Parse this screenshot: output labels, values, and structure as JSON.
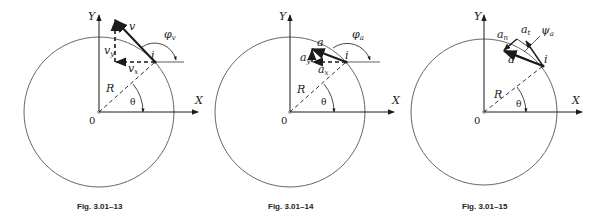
{
  "figures": [
    {
      "id": "fig13",
      "caption": "Fig. 3.01–13",
      "axis_x": "X",
      "axis_y": "Y",
      "origin": "0",
      "radius_label": "R",
      "angle_label": "θ",
      "point_label": "i",
      "vector_label": "v",
      "component_y": "v",
      "component_y_sub": "y",
      "component_x": "v",
      "component_x_sub": "x",
      "angle2": "φ",
      "angle2_sub": "v"
    },
    {
      "id": "fig14",
      "caption": "Fig. 3.01–14",
      "axis_x": "X",
      "axis_y": "Y",
      "origin": "0",
      "radius_label": "R",
      "angle_label": "θ",
      "point_label": "i",
      "vector_label": "a",
      "component_y": "a",
      "component_y_sub": "y",
      "component_x": "a",
      "component_x_sub": "x",
      "angle2": "φ",
      "angle2_sub": "a"
    },
    {
      "id": "fig15",
      "caption": "Fig. 3.01–15",
      "axis_x": "X",
      "axis_y": "Y",
      "origin": "0",
      "radius_label": "R",
      "angle_label": "θ",
      "point_label": "i",
      "vector_label": "a",
      "component_n": "a",
      "component_n_sub": "n",
      "component_t": "a",
      "component_t_sub": "t",
      "angle2": "ψ",
      "angle2_sub": "a"
    }
  ],
  "colors": {
    "ink": "#1a1a1a",
    "circle": "#555555",
    "background": "#ffffff"
  }
}
